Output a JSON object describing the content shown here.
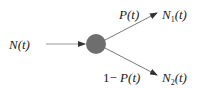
{
  "diagram": {
    "input_label": {
      "var": "N",
      "arg": "(t)"
    },
    "upper_prob": {
      "var": "P",
      "arg": "(t)"
    },
    "lower_prob": {
      "prefix": "1− ",
      "var": "P",
      "arg": "(t)"
    },
    "output_1": {
      "var": "N",
      "sub": "1",
      "arg": "(t)"
    },
    "output_2": {
      "var": "N",
      "sub": "2",
      "arg": "(t)"
    },
    "colors": {
      "node_fill": "#6e6e6e",
      "line": "#555555",
      "text": "#1a1a1a"
    }
  }
}
